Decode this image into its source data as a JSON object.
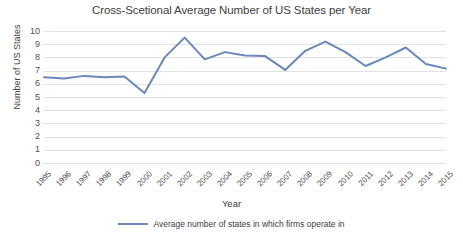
{
  "chart_data": {
    "type": "line",
    "title": "Cross-Scetional Average Number of US States per Year",
    "xlabel": "Year",
    "ylabel": "Number of US States",
    "categories": [
      "1995",
      "1996",
      "1997",
      "1998",
      "1999",
      "2000",
      "2001",
      "2002",
      "2003",
      "2004",
      "2005",
      "2006",
      "2007",
      "2008",
      "2009",
      "2010",
      "2011",
      "2012",
      "2013",
      "2014",
      "2015"
    ],
    "series": [
      {
        "name": "Average number of states in which firms operate in",
        "color": "#6b87bb",
        "values": [
          6.5,
          6.4,
          6.6,
          6.5,
          6.55,
          5.3,
          8.0,
          9.5,
          7.85,
          8.4,
          8.15,
          8.1,
          7.05,
          8.5,
          9.2,
          8.4,
          7.35,
          8.0,
          8.75,
          7.5,
          7.15
        ]
      }
    ],
    "ylim": [
      0,
      10
    ],
    "ytick_labels": [
      "10",
      "9",
      "8",
      "7",
      "6",
      "5",
      "4",
      "3",
      "2",
      "1",
      "0"
    ],
    "ytick_values": [
      10,
      9,
      8,
      7,
      6,
      5,
      4,
      3,
      2,
      1,
      0
    ],
    "grid": true,
    "legend_position": "bottom",
    "gridline_color": "#e2e2e2",
    "text_color": "#404040"
  },
  "legend": {
    "entries": [
      {
        "label": "Average number of states in which firms operate in",
        "color": "#6b87bb"
      }
    ]
  }
}
